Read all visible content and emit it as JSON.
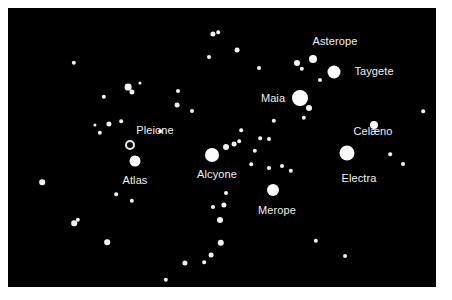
{
  "figure": {
    "background_color": "#ffffff",
    "sky_color": "#000000",
    "star_color": "#f2f2f2",
    "label_color": "#f0f0f0",
    "width": 452,
    "height": 300
  },
  "chart_data": {
    "type": "scatter",
    "title": "",
    "xlabel": "",
    "ylabel": "",
    "xlim": [
      0,
      428
    ],
    "ylim": [
      0,
      279
    ],
    "grid": false,
    "legend": "none",
    "note": "Positions are pixel coordinates within the black sky field; r is the drawn star radius in pixels which encodes apparent brightness.",
    "labeled_stars": [
      {
        "name": "Pleione",
        "x": 122,
        "y": 137,
        "r": 5.0,
        "style": "ring",
        "label_x": 147,
        "label_y": 122,
        "label_anchor": "above"
      },
      {
        "name": "Atlas",
        "x": 127,
        "y": 153,
        "r": 5.5,
        "style": "disk",
        "label_x": 127,
        "label_y": 172,
        "label_anchor": "below"
      },
      {
        "name": "Alcyone",
        "x": 204,
        "y": 147,
        "r": 7.0,
        "style": "disk",
        "label_x": 209,
        "label_y": 166,
        "label_anchor": "below"
      },
      {
        "name": "Merope",
        "x": 265,
        "y": 182,
        "r": 6.0,
        "style": "disk",
        "label_x": 269,
        "label_y": 202,
        "label_anchor": "below"
      },
      {
        "name": "Maia",
        "x": 292,
        "y": 90,
        "r": 8.0,
        "style": "disk",
        "label_x": 265,
        "label_y": 90,
        "label_anchor": "left"
      },
      {
        "name": "Taygete",
        "x": 326,
        "y": 64,
        "r": 6.5,
        "style": "disk",
        "label_x": 366,
        "label_y": 63,
        "label_anchor": "right"
      },
      {
        "name": "Asterope",
        "x": 305,
        "y": 51,
        "r": 4.0,
        "style": "disk",
        "label_x": 327,
        "label_y": 33,
        "label_anchor": "above"
      },
      {
        "name": "Celæno",
        "x": 366,
        "y": 117,
        "r": 4.0,
        "style": "disk",
        "label_x": 365,
        "label_y": 123,
        "label_anchor": "below"
      },
      {
        "name": "Electra",
        "x": 339,
        "y": 145,
        "r": 7.5,
        "style": "disk",
        "label_x": 351,
        "label_y": 170,
        "label_anchor": "below"
      }
    ],
    "field_stars": [
      {
        "x": 66,
        "y": 55,
        "r": 2.2
      },
      {
        "x": 96,
        "y": 89,
        "r": 2.2
      },
      {
        "x": 120,
        "y": 79,
        "r": 3.4
      },
      {
        "x": 124,
        "y": 84,
        "r": 2.6
      },
      {
        "x": 132,
        "y": 75,
        "r": 1.6
      },
      {
        "x": 87,
        "y": 117,
        "r": 1.6
      },
      {
        "x": 101,
        "y": 116,
        "r": 2.6
      },
      {
        "x": 113,
        "y": 113,
        "r": 1.8
      },
      {
        "x": 92,
        "y": 125,
        "r": 2.2
      },
      {
        "x": 169,
        "y": 97,
        "r": 2.4
      },
      {
        "x": 184,
        "y": 103,
        "r": 2.0
      },
      {
        "x": 170,
        "y": 83,
        "r": 2.0
      },
      {
        "x": 205,
        "y": 26,
        "r": 2.6
      },
      {
        "x": 210,
        "y": 24,
        "r": 1.8
      },
      {
        "x": 201,
        "y": 49,
        "r": 2.0
      },
      {
        "x": 229,
        "y": 42,
        "r": 2.4
      },
      {
        "x": 251,
        "y": 60,
        "r": 2.0
      },
      {
        "x": 289,
        "y": 55,
        "r": 3.0
      },
      {
        "x": 294,
        "y": 61,
        "r": 2.2
      },
      {
        "x": 312,
        "y": 72,
        "r": 2.0
      },
      {
        "x": 301,
        "y": 100,
        "r": 3.0
      },
      {
        "x": 296,
        "y": 110,
        "r": 2.2
      },
      {
        "x": 266,
        "y": 113,
        "r": 2.2
      },
      {
        "x": 252,
        "y": 130,
        "r": 1.8
      },
      {
        "x": 261,
        "y": 131,
        "r": 2.0
      },
      {
        "x": 247,
        "y": 143,
        "r": 2.2
      },
      {
        "x": 218,
        "y": 139,
        "r": 3.0
      },
      {
        "x": 226,
        "y": 136,
        "r": 2.4
      },
      {
        "x": 231,
        "y": 133,
        "r": 1.8
      },
      {
        "x": 243,
        "y": 156,
        "r": 1.8
      },
      {
        "x": 261,
        "y": 160,
        "r": 2.0
      },
      {
        "x": 274,
        "y": 158,
        "r": 2.0
      },
      {
        "x": 283,
        "y": 163,
        "r": 2.2
      },
      {
        "x": 218,
        "y": 185,
        "r": 2.0
      },
      {
        "x": 216,
        "y": 197,
        "r": 2.6
      },
      {
        "x": 205,
        "y": 199,
        "r": 2.0
      },
      {
        "x": 212,
        "y": 212,
        "r": 3.0
      },
      {
        "x": 213,
        "y": 235,
        "r": 3.2
      },
      {
        "x": 203,
        "y": 247,
        "r": 2.4
      },
      {
        "x": 196,
        "y": 254,
        "r": 1.8
      },
      {
        "x": 177,
        "y": 255,
        "r": 2.6
      },
      {
        "x": 158,
        "y": 272,
        "r": 2.2
      },
      {
        "x": 99,
        "y": 234,
        "r": 2.8
      },
      {
        "x": 66,
        "y": 215,
        "r": 2.8
      },
      {
        "x": 70,
        "y": 212,
        "r": 2.2
      },
      {
        "x": 34,
        "y": 174,
        "r": 2.8
      },
      {
        "x": 108,
        "y": 186,
        "r": 1.8
      },
      {
        "x": 124,
        "y": 193,
        "r": 2.2
      },
      {
        "x": 308,
        "y": 233,
        "r": 2.2
      },
      {
        "x": 337,
        "y": 248,
        "r": 2.0
      },
      {
        "x": 395,
        "y": 156,
        "r": 2.0
      },
      {
        "x": 382,
        "y": 146,
        "r": 1.8
      },
      {
        "x": 415,
        "y": 103,
        "r": 1.8
      },
      {
        "x": 233,
        "y": 122,
        "r": 1.8
      },
      {
        "x": 152,
        "y": 123,
        "r": 1.8
      }
    ]
  }
}
